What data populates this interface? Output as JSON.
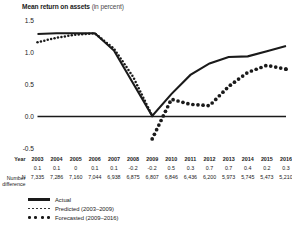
{
  "chart_data": {
    "type": "line",
    "title": "Mean return on assets",
    "title_unit": "(in percent)",
    "xlabel": "Year",
    "ylabel": "",
    "ylim": [
      -0.5,
      1.5
    ],
    "yticks": [
      "1.5",
      "1.0",
      "0.5",
      "0.0",
      "-0.5"
    ],
    "ytick_values": [
      1.5,
      1.0,
      0.5,
      0.0,
      -0.5
    ],
    "grid": false,
    "zero_line": true,
    "legend_position": "below-left",
    "x": [
      2003,
      2004,
      2005,
      2006,
      2007,
      2008,
      2009,
      2010,
      2011,
      2012,
      2013,
      2014,
      2015,
      2016
    ],
    "categories": [
      "2003",
      "2004",
      "2005",
      "2006",
      "2007",
      "2008",
      "2009",
      "2010",
      "2011",
      "2012",
      "2013",
      "2014",
      "2015",
      "2016"
    ],
    "series": [
      {
        "name": "Actual",
        "style": "solid",
        "values": [
          1.29,
          1.3,
          1.3,
          1.3,
          1.03,
          0.52,
          0.01,
          0.35,
          0.65,
          0.83,
          0.93,
          0.94,
          1.02,
          1.1
        ]
      },
      {
        "name": "Predicted (2003–2009)",
        "style": "dotted-small",
        "values": [
          1.16,
          1.23,
          1.28,
          1.3,
          1.06,
          0.62,
          0.01,
          null,
          null,
          null,
          null,
          null,
          null,
          null
        ]
      },
      {
        "name": "Forecasted (2009–2016)",
        "style": "dotted-large",
        "values": [
          null,
          null,
          null,
          null,
          null,
          null,
          -0.35,
          0.27,
          0.19,
          0.17,
          0.47,
          0.69,
          0.8,
          0.74
        ]
      }
    ],
    "legend": [
      {
        "label": "Actual",
        "marker": "solid-line"
      },
      {
        "label": "Predicted (2003–2009)",
        "marker": "small-dots"
      },
      {
        "label": "Forecasted (2009–2016)",
        "marker": "large-dots"
      }
    ],
    "table": {
      "year_row_label": "Year",
      "diff_row_label_line1": "Number",
      "diff_row_label_line2": "difference",
      "n_row_label": "N",
      "years": [
        "2003",
        "2004",
        "2005",
        "2006",
        "2007",
        "2008",
        "2009",
        "2010",
        "2011",
        "2012",
        "2013",
        "2014",
        "2015",
        "2016"
      ],
      "number_difference": [
        "0.1",
        "0.1",
        "0",
        "0.1",
        "0.1",
        "-0.2",
        "-0.2",
        "0.5",
        "0.3",
        "0.7",
        "0.7",
        "0.4",
        "0.2",
        "0.3"
      ],
      "n": [
        "7,335",
        "7,286",
        "7,160",
        "7,044",
        "6,938",
        "6,875",
        "6,807",
        "6,846",
        "6,436",
        "6,200",
        "5,973",
        "5,745",
        "5,473",
        "5,210"
      ]
    },
    "colors": {
      "line": "#1a1a1a",
      "background": "#ffffff",
      "text": "#1a1a1a"
    }
  }
}
